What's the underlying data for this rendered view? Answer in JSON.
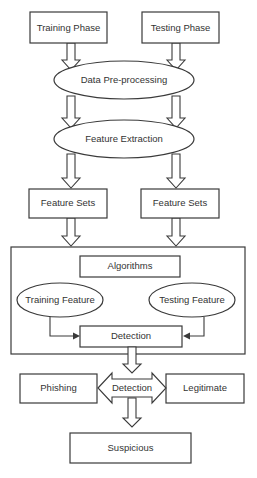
{
  "diagram": {
    "title": "",
    "nodes": {
      "training_phase": "Training Phase",
      "testing_phase": "Testing Phase",
      "data_preprocessing": "Data Pre-processing",
      "feature_extraction": "Feature Extraction",
      "feature_sets_left": "Feature Sets",
      "feature_sets_right": "Feature Sets",
      "algorithms": "Algorithms",
      "training_feature": "Training Feature",
      "testing_feature": "Testing Feature",
      "detection_inner": "Detection",
      "detection_hub": "Detection",
      "phishing": "Phishing",
      "legitimate": "Legitimate",
      "suspicious": "Suspicious"
    },
    "edges": [
      {
        "from": "Training Phase",
        "to": "Data Pre-processing"
      },
      {
        "from": "Testing Phase",
        "to": "Data Pre-processing"
      },
      {
        "from": "Data Pre-processing",
        "to": "Feature Extraction"
      },
      {
        "from": "Feature Extraction",
        "to": "Feature Sets (left)"
      },
      {
        "from": "Feature Extraction",
        "to": "Feature Sets (right)"
      },
      {
        "from": "Feature Sets (left)",
        "to": "Algorithms block"
      },
      {
        "from": "Feature Sets (right)",
        "to": "Algorithms block"
      },
      {
        "from": "Training Feature",
        "to": "Detection"
      },
      {
        "from": "Testing Feature",
        "to": "Detection"
      },
      {
        "from": "Detection",
        "to": "Detection hub"
      },
      {
        "from": "Detection hub",
        "to": "Phishing"
      },
      {
        "from": "Detection hub",
        "to": "Legitimate"
      },
      {
        "from": "Detection hub",
        "to": "Suspicious"
      }
    ],
    "colors": {
      "stroke": "#3a3a3a",
      "text": "#333333",
      "background": "#ffffff"
    }
  }
}
